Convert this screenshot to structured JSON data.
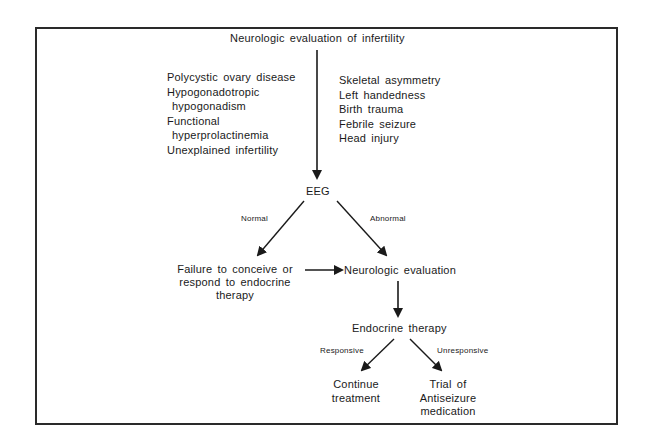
{
  "diagram": {
    "title": "Neurologic evaluation of infertility",
    "left_conditions": [
      {
        "line1": "Polycystic ovary disease"
      },
      {
        "line1": "Hypogonadotropic",
        "line2": "hypogonadism"
      },
      {
        "line1": "Functional",
        "line2": "hyperprolactinemia"
      },
      {
        "line1": "Unexplained infertility"
      }
    ],
    "right_conditions": [
      "Skeletal asymmetry",
      "Left handedness",
      "Birth trauma",
      "Febrile seizure",
      "Head injury"
    ],
    "nodes": {
      "eeg": "EEG",
      "failure_line1": "Failure to conceive or",
      "failure_line2": "respond to endocrine",
      "failure_line3": "therapy",
      "neuro_eval": "Neurologic evaluation",
      "endocrine": "Endocrine therapy",
      "continue_line1": "Continue",
      "continue_line2": "treatment",
      "trial_line1": "Trial of",
      "trial_line2": "Antiseizure",
      "trial_line3": "medication"
    },
    "edge_labels": {
      "normal": "Normal",
      "abnormal": "Abnormal",
      "responsive": "Responsive",
      "unresponsive": "Unresponsive"
    },
    "colors": {
      "line": "#1a1a1a",
      "frame": "#2a2a2a",
      "background": "#ffffff"
    }
  }
}
